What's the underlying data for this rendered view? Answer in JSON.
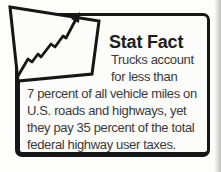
{
  "stat_fact_box": {
    "title": "Stat Fact",
    "body_lines": [
      "Trucks account",
      "for less than",
      "7 percent of all vehicle miles on",
      "U.S. roads and highways, yet",
      "they pay 35 percent of the total",
      "federal highway user taxes."
    ],
    "icon": "trend-up-chart-icon",
    "colors": {
      "border": "#161616",
      "box_background": "#fcfcfa",
      "title_text": "#1c1c1c",
      "body_text": "#3a3a3a",
      "scan_edge": "#c9c9c7"
    }
  }
}
